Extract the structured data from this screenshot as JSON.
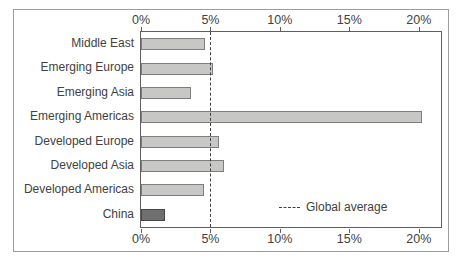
{
  "chart_data": {
    "type": "bar",
    "orientation": "horizontal",
    "title": "",
    "categories": [
      "Middle East",
      "Emerging Europe",
      "Emerging Asia",
      "Emerging Americas",
      "Developed Europe",
      "Developed Asia",
      "Developed Americas",
      "China"
    ],
    "values": [
      4.6,
      5.2,
      3.6,
      20.2,
      5.6,
      6.0,
      4.5,
      1.7
    ],
    "unit": "%",
    "highlight_category": "China",
    "axis": {
      "ticks": [
        0,
        5,
        10,
        15,
        20
      ],
      "tick_labels": [
        "0%",
        "5%",
        "10%",
        "15%",
        "20%"
      ],
      "max": 21.6,
      "positions": "top and bottom",
      "grid": false
    },
    "reference_line": {
      "value": 5,
      "label": "Global average",
      "style": "dashed"
    },
    "colors": {
      "bar_fill": "#c7c8c6",
      "bar_border": "#7e7e7e",
      "highlight_fill": "#6f6f6f",
      "highlight_border": "#474747",
      "reference_line": "#3f3f3f",
      "text": "#414141",
      "plot_border": "#5f5f5f",
      "outer_frame": "#9c9c9c",
      "background": "#ffffff"
    },
    "legend_position": "inside bottom-right"
  }
}
